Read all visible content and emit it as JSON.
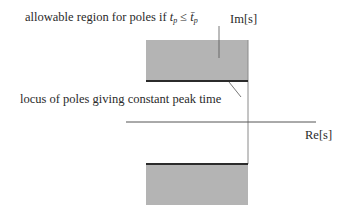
{
  "diagram": {
    "type": "s-plane pole region",
    "labels": {
      "allowable_region_prefix": "allowable region for poles if ",
      "tp": "t",
      "tp_sub": "p",
      "leq": " ≤ ",
      "tbar": "t̄",
      "tbar_sub": "p",
      "locus": "locus of poles giving constant peak time",
      "im_axis": "Im[s]",
      "re_axis": "Re[s]"
    },
    "colors": {
      "region_fill": "#b4b4b4",
      "locus_line": "#2b2b2b",
      "axis": "#8a8a8a",
      "leader": "#555555"
    },
    "geometry": {
      "upper_region": {
        "x": 146,
        "y": 40,
        "w": 102,
        "h": 41
      },
      "lower_region": {
        "x": 146,
        "y": 164,
        "w": 102,
        "h": 41
      },
      "upper_locus_y": 81,
      "lower_locus_y": 164,
      "im_axis_x": 248,
      "re_axis_y": 122,
      "re_axis_x_start": 126,
      "re_axis_x_end": 316
    }
  }
}
